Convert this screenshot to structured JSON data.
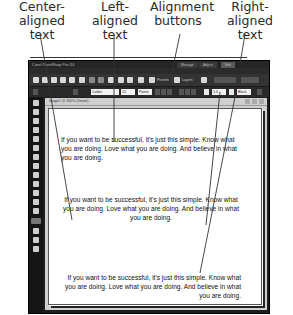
{
  "callouts": [
    {
      "label": "Center-aligned\ntext"
    },
    {
      "label": "Left-aligned\ntext"
    },
    {
      "label": "Alignment\nbuttons"
    },
    {
      "label": "Right-aligned\ntext"
    }
  ],
  "app": {
    "title": "Corel PaintShop Pro X4",
    "workspace_tabs": [
      "Manage",
      "Adjust",
      "Edit"
    ],
    "menu": [
      "File",
      "Edit",
      "View",
      "Image",
      "Adjust",
      "Effects",
      "Layers",
      "Objects",
      "Selections",
      "Window",
      "Help"
    ],
    "toolbar": {
      "labels": [
        "Presets",
        "Layers"
      ]
    },
    "property_bar": {
      "font_field": "Calibri",
      "size_field": "12",
      "units_field": "Points",
      "stroke_field": "1.0",
      "color_field": "Black"
    },
    "document": {
      "tab_label": "Image1 @ 100% (Vector)"
    }
  },
  "paragraphs": {
    "left": "If you want to be successful, it's just this simple. Know what you are doing. Love what you are doing. And believe in what you are doing.",
    "center": "If you want to be successful, it's just this simple. Know what you are doing. Love what you are doing. And believe in what you are doing.",
    "right": "If you want to be successful, it's just this simple. Know what you are doing. Love what you are doing. And believe in what you are doing."
  },
  "colors": {
    "ui_dark": "#1e1e1e",
    "page": "#ffffff",
    "leader_line": "#333333"
  }
}
